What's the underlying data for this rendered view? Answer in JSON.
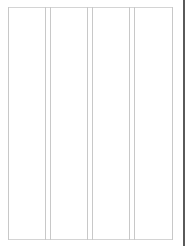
{
  "page": {
    "layout": "four-column",
    "columns": [
      {
        "index": 1,
        "content": ""
      },
      {
        "index": 2,
        "content": ""
      },
      {
        "index": 3,
        "content": ""
      },
      {
        "index": 4,
        "content": ""
      }
    ]
  },
  "colors": {
    "background": "#ffffff",
    "column_border": "#c8c8c8",
    "frame_border": "#d4d4d4",
    "edge_bar": "#5a5a5a"
  }
}
